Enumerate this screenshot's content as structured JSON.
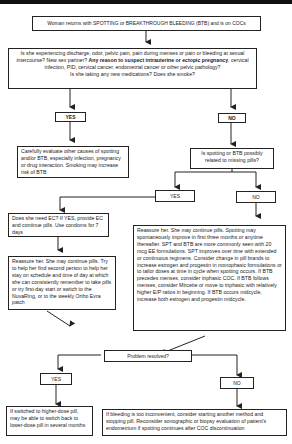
{
  "flowchart": {
    "start": "Woman returns with SPOTTING or BREAKTHROUGH BLEEDING (BTB) and is on COCs",
    "question1": {
      "part1": "Is she experiencing discharge, odor, pelvic pain, pain during menses or pain or bleeding at sexual intercourse?  New sex partner? ",
      "bold": "Any reason to suspect intrauterine or ectopic pregnancy",
      "part2": ", cervical infection, PID, cervical cancer, endometrial cancer or other pelvic pathology?",
      "part3": "Is she taking any new medications? Does she smoke?"
    },
    "yes1": "YES",
    "no1": "NO",
    "evaluate": "Carefully evaluate other causes of spotting and/or BTB, especially infection, pregnancy or drug interaction. Smoking may increase risk of BTB",
    "missing_pills_q": "Is spotting or BTB possibly related to missing pills?",
    "yes2": "YES",
    "no2": "NO",
    "ec": "Does she need EC?  If YES, provide EC and continue pills. Use condoms for 7 days",
    "reassure_missed": "Reassure her. She may continue pills. Try to help her find second person to help her stay on schedule and time of day at which she can consistently remember to take pills or try first-day start or switch to the NuvaRing, or to the weekly Ortho Evra patch",
    "reassure_not_missed": "Reassure her. She may continue pills. Spotting may spontaneously improve in first three months or anytime thereafter. SPT and BTB are more commonly seen with 20 mcg EE formulations. SPT improves over time with extended or continuous regimens. Consider change in pill brands to increase estrogen and progestin in monophasic formulations or to tailor doses at time in cycle when spotting occurs. If BTB precedes menses, consider triphasic COC. If BTB follows menses, consider Mircette or move to triphasic with relatively higher E/P ratios in beginning. If BTB occurs midcycle, increase both estrogen and progestin midcycle.",
    "resolved_q": "Problem resolved?",
    "yes3": "YES",
    "no3": "NO",
    "yes_outcome": "If switched to higher-dose pill, may be able to switch back to lower-dose pill in several months",
    "no_outcome": "If bleeding is too inconvenient, consider starting another method and stopping pill. Reconsider sonographic or biopsy evaluation of patient's endometrium if spotting continues after COC discontinuation"
  }
}
